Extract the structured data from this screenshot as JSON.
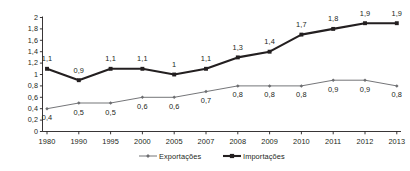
{
  "chart_data": {
    "type": "line",
    "title": "",
    "subtitle": "",
    "xlabel": "",
    "ylabel": "",
    "categories": [
      "1980",
      "1990",
      "1995",
      "2000",
      "2005",
      "2007",
      "2008",
      "2009",
      "2010",
      "2011",
      "2012",
      "2013"
    ],
    "ylim": [
      0,
      2
    ],
    "yticks": [
      "0",
      "0,2",
      "0,4",
      "0,6",
      "0,8",
      "1",
      "1,2",
      "1,4",
      "1,6",
      "1,8",
      "2"
    ],
    "ytick_values": [
      0,
      0.2,
      0.4,
      0.6,
      0.8,
      1.0,
      1.2,
      1.4,
      1.6,
      1.8,
      2.0
    ],
    "grid": false,
    "legend_position": "bottom",
    "decimal_separator": ",",
    "series": [
      {
        "name": "Exportações",
        "color": "#6d6e71",
        "marker": "diamond",
        "label_position": "below",
        "values": [
          0.4,
          0.5,
          0.5,
          0.6,
          0.6,
          0.7,
          0.8,
          0.8,
          0.8,
          0.9,
          0.9,
          0.8
        ],
        "labels": [
          "0,4",
          "0,5",
          "0,5",
          "0,6",
          "0,6",
          "0,7",
          "0,8",
          "0,8",
          "0,8",
          "0,9",
          "0,9",
          "0,8"
        ]
      },
      {
        "name": "Importações",
        "color": "#231f20",
        "marker": "square",
        "label_position": "above",
        "values": [
          1.1,
          0.9,
          1.1,
          1.1,
          1.0,
          1.1,
          1.3,
          1.4,
          1.7,
          1.8,
          1.9,
          1.9
        ],
        "labels": [
          "1,1",
          "0,9",
          "1,1",
          "1,1",
          "1",
          "1,1",
          "1,3",
          "1,4",
          "1,7",
          "1,8",
          "1,9",
          "1,9"
        ]
      }
    ]
  },
  "legend": {
    "items": [
      {
        "label": "Exportações",
        "color": "#6d6e71",
        "marker": "diamond"
      },
      {
        "label": "Importações",
        "color": "#231f20",
        "marker": "square"
      }
    ]
  },
  "axes": {
    "axis_color": "#231f20",
    "tick_color": "#231f20"
  }
}
